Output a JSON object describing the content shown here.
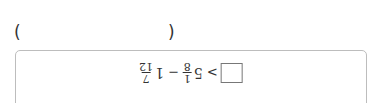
{
  "answer_parens": {
    "left": "(",
    "right": ")"
  },
  "expression": {
    "rotated_180": true,
    "answer_box": "",
    "comparator": ">",
    "term1": {
      "whole": "5",
      "numerator": "1",
      "denominator": "8"
    },
    "operator": "−",
    "term2": {
      "whole": "1",
      "numerator": "7",
      "denominator": "12"
    }
  },
  "colors": {
    "border": "#bdbdbd",
    "text": "#333333"
  }
}
